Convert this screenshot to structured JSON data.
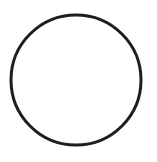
{
  "canvas": {
    "width": 157,
    "height": 162,
    "background": "#ffffff"
  },
  "shape": {
    "type": "circle",
    "cx": 76,
    "cy": 80,
    "r": 65,
    "stroke": "#1e1e1e",
    "stroke_width": 3,
    "fill": "none"
  }
}
